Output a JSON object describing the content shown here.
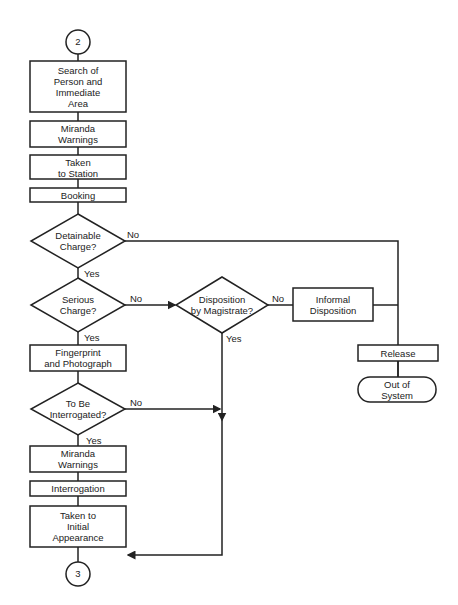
{
  "connectors": {
    "top": "2",
    "bottom": "3"
  },
  "nodes": {
    "search": [
      "Search of",
      "Person and",
      "Immediate",
      "Area"
    ],
    "miranda1": [
      "Miranda",
      "Warnings"
    ],
    "station": [
      "Taken",
      "to Station"
    ],
    "booking": [
      "Booking"
    ],
    "detainable": [
      "Detainable",
      "Charge?"
    ],
    "serious": [
      "Serious",
      "Charge?"
    ],
    "magistrate": [
      "Disposition",
      "by Magistrate?"
    ],
    "informal": [
      "Informal",
      "Disposition"
    ],
    "release": [
      "Release"
    ],
    "out": [
      "Out of",
      "System"
    ],
    "fingerprint": [
      "Fingerprint",
      "and Photograph"
    ],
    "interrogated": [
      "To Be",
      "Interrogated?"
    ],
    "miranda2": [
      "Miranda",
      "Warnings"
    ],
    "interrogation": [
      "Interrogation"
    ],
    "initial": [
      "Taken to",
      "Initial",
      "Appearance"
    ]
  },
  "edges": {
    "detainable_no": "No",
    "detainable_yes": "Yes",
    "serious_no": "No",
    "serious_yes": "Yes",
    "magistrate_no": "No",
    "magistrate_yes": "Yes",
    "interrogated_no": "No",
    "interrogated_yes": "Yes"
  }
}
